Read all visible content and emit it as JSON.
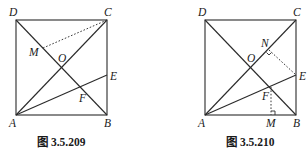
{
  "figures": [
    {
      "caption": "图 3.5.209",
      "labels": {
        "A": "A",
        "B": "B",
        "C": "C",
        "D": "D",
        "E": "E",
        "F": "F",
        "M": "M",
        "O": "O"
      },
      "segments_solid": [
        "AB",
        "BC",
        "CD",
        "DA",
        "AC",
        "BD",
        "AE"
      ],
      "segments_dashed": [
        "CM"
      ],
      "right_angle_marks": []
    },
    {
      "caption": "图 3.5.210",
      "labels": {
        "A": "A",
        "B": "B",
        "C": "C",
        "D": "D",
        "E": "E",
        "F": "F",
        "M": "M",
        "N": "N",
        "O": "O"
      },
      "segments_solid": [
        "AB",
        "BC",
        "CD",
        "DA",
        "AC",
        "BD",
        "AE"
      ],
      "segments_dashed": [
        "EN",
        "FM"
      ],
      "right_angle_marks": [
        "N",
        "M"
      ]
    }
  ]
}
